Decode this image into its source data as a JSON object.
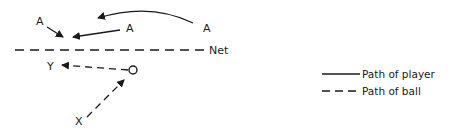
{
  "diagram": {
    "net_label": "Net",
    "players": [
      {
        "id": "A-left",
        "label": "A"
      },
      {
        "id": "A-middle",
        "label": "A"
      },
      {
        "id": "A-right",
        "label": "A"
      },
      {
        "id": "X",
        "label": "X"
      },
      {
        "id": "Y",
        "label": "Y"
      }
    ],
    "ball_label": "ball"
  },
  "legend": {
    "items": [
      {
        "style": "solid",
        "label": "Path of player"
      },
      {
        "style": "dashed",
        "label": "Path of ball"
      }
    ]
  }
}
